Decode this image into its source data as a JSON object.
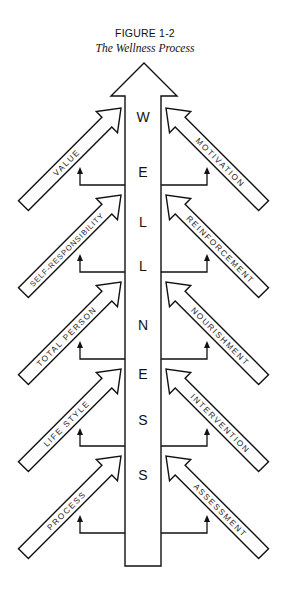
{
  "figure": {
    "number": "FIGURE 1-2",
    "title": "The Wellness Process"
  },
  "center": {
    "letters": [
      "W",
      "E",
      "L",
      "L",
      "N",
      "E",
      "S",
      "S"
    ],
    "letter_y": [
      122,
      177,
      227,
      271,
      330,
      379,
      425,
      480
    ]
  },
  "left_arrows": [
    {
      "label": "VALUE"
    },
    {
      "label": "SELF-RESPONSIBILITY"
    },
    {
      "label": "TOTAL PERSON"
    },
    {
      "label": "LIFE STYLE"
    },
    {
      "label": "PROCESS"
    }
  ],
  "right_arrows": [
    {
      "label": "MOTIVATION"
    },
    {
      "label": "REINFORCEMENT"
    },
    {
      "label": "NOURISHMENT"
    },
    {
      "label": "INTERVENTION"
    },
    {
      "label": "ASSESSMENT"
    }
  ],
  "colors": {
    "stroke": "#111111",
    "background": "#ffffff"
  }
}
